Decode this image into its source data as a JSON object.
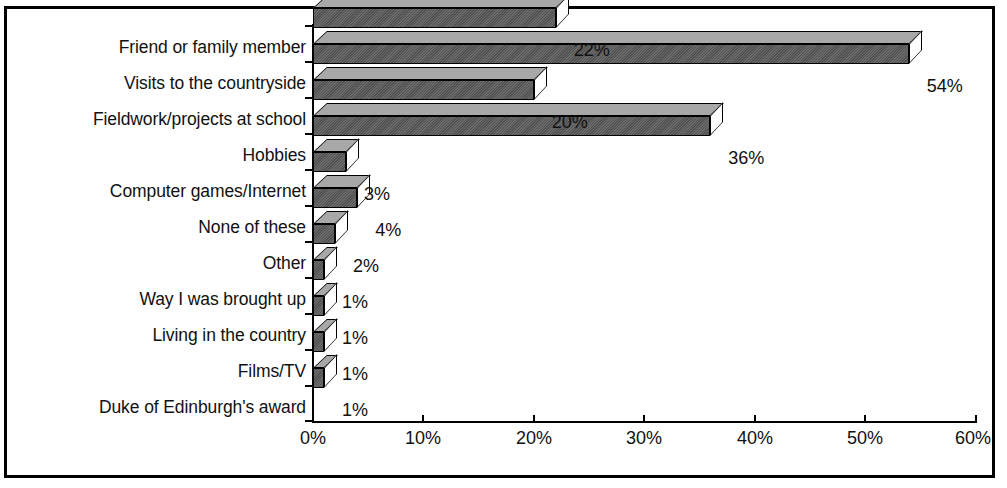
{
  "chart_data": {
    "type": "bar",
    "orientation": "horizontal",
    "style": "3d",
    "title": "",
    "subtitle": "",
    "xlabel": "",
    "ylabel": "",
    "grid": false,
    "legend": null,
    "xlim": [
      0,
      60
    ],
    "xtick_labels": [
      "0%",
      "10%",
      "20%",
      "30%",
      "40%",
      "50%",
      "60%"
    ],
    "xticks": [
      0,
      10,
      20,
      30,
      40,
      50,
      60
    ],
    "value_suffix": "%",
    "categories": [
      "Friend or family member",
      "Visits to the countryside",
      "Fieldwork/projects at school",
      "Hobbies",
      "Computer games/Internet",
      "None of these",
      "Other",
      "Way I was brought up",
      "Living in the country",
      "Films/TV",
      "Duke of Edinburgh's award"
    ],
    "values": [
      22,
      54,
      20,
      36,
      3,
      4,
      2,
      1,
      1,
      1,
      1
    ],
    "value_labels": [
      "22%",
      "54%",
      "20%",
      "36%",
      "3%",
      "4%",
      "2%",
      "1%",
      "1%",
      "1%",
      "1%"
    ],
    "colors": {
      "bar_front": "#5a5a5a",
      "bar_top": "#a8a8a8",
      "bar_cap": "#ffffff",
      "outline": "#000000",
      "text": "#111111",
      "background": "#ffffff",
      "frame": "#000000"
    }
  }
}
